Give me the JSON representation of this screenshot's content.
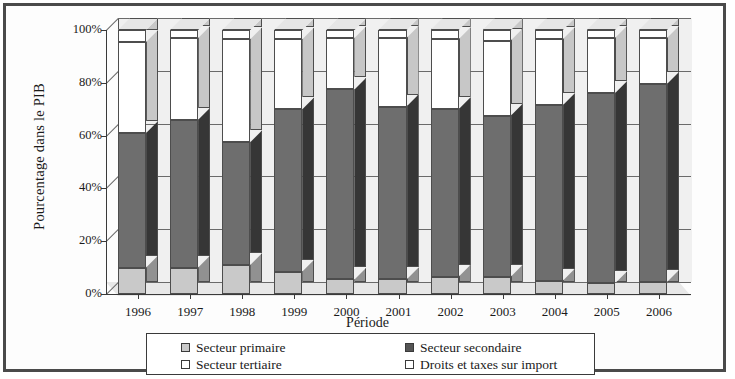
{
  "chart_data": {
    "type": "bar",
    "subtype": "stacked-100-percent-3d",
    "title": "",
    "xlabel": "Période",
    "ylabel": "Pourcentage dans le PIB",
    "categories": [
      "1996",
      "1997",
      "1998",
      "1999",
      "2000",
      "2001",
      "2002",
      "2003",
      "2004",
      "2005",
      "2006"
    ],
    "ytick_labels": [
      "0%",
      "20%",
      "40%",
      "60%",
      "80%",
      "100%"
    ],
    "ytick_values": [
      0,
      20,
      40,
      60,
      80,
      100
    ],
    "ylim": [
      0,
      100
    ],
    "grid": true,
    "legend_position": "bottom",
    "series": [
      {
        "name": "Secteur primaire",
        "color": "#c9c9c9",
        "values": [
          10.0,
          10.0,
          11.0,
          8.5,
          5.5,
          5.5,
          6.5,
          6.5,
          5.0,
          4.0,
          4.5
        ]
      },
      {
        "name": "Secteur secondaire",
        "color": "#6e6e6e",
        "values": [
          51.0,
          56.0,
          46.5,
          61.5,
          72.0,
          65.5,
          63.5,
          61.0,
          66.5,
          72.0,
          75.0
        ]
      },
      {
        "name": "Secteur tertiaire",
        "color": "#ffffff",
        "values": [
          34.5,
          31.0,
          39.0,
          26.5,
          19.5,
          26.0,
          26.5,
          28.5,
          25.0,
          21.0,
          17.5
        ]
      },
      {
        "name": "Droits et taxes sur import",
        "color": "#ffffff",
        "values": [
          4.5,
          3.0,
          3.5,
          3.5,
          3.0,
          3.0,
          3.5,
          4.0,
          3.5,
          3.0,
          3.0
        ]
      }
    ]
  },
  "legend": {
    "entries": [
      {
        "label": "Secteur primaire",
        "swatch": "#c9c9c9"
      },
      {
        "label": "Secteur secondaire",
        "swatch": "#555555"
      },
      {
        "label": "Secteur tertiaire",
        "swatch": "#ffffff"
      },
      {
        "label": "Droits et taxes sur import",
        "swatch": "#ffffff"
      }
    ]
  },
  "colors": {
    "primaire": "#c9c9c9",
    "secondaire": "#6e6e6e",
    "tertiaire": "#ffffff",
    "droits": "#ffffff",
    "plot_background": "#f0f0f0",
    "border": "#4a4a4a",
    "axis": "#3a3a3a"
  }
}
